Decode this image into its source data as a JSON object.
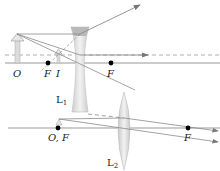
{
  "diagram": {
    "top": {
      "lens_label": "L",
      "lens_sub": "1",
      "labels": {
        "object": "O",
        "focal_left": "F",
        "image": "I",
        "focal_right": "F"
      }
    },
    "bottom": {
      "lens_label": "L",
      "lens_sub": "2",
      "labels": {
        "object_focal": "O, F",
        "focal_right": "F"
      }
    },
    "colors": {
      "axis": "#888888",
      "ray": "#8a8a8a",
      "lens": "#d6d6d6",
      "arrow": "#c8c8c8",
      "point": "#000000"
    }
  }
}
